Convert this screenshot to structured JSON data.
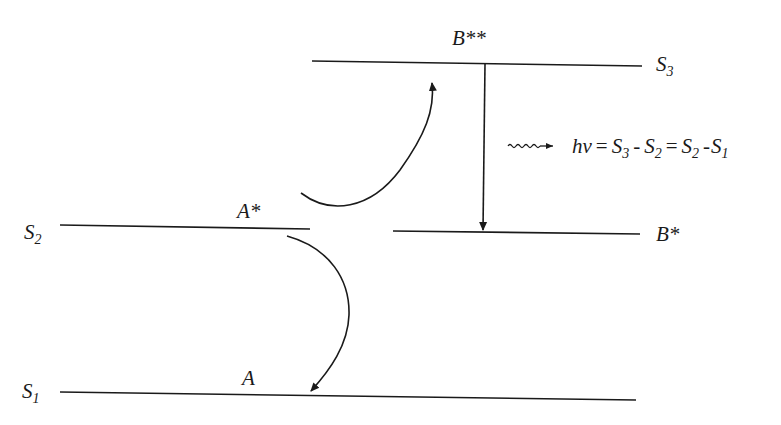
{
  "diagram": {
    "levels": {
      "s1": {
        "symbol": "S",
        "sub": "1",
        "label": "A"
      },
      "s2": {
        "symbol": "S",
        "sub": "2",
        "label": "A*"
      },
      "s2_b": {
        "label": "B*"
      },
      "s3": {
        "symbol": "S",
        "sub": "3",
        "label": "B**"
      }
    },
    "equation": {
      "lhs": "hν",
      "eq1": "=",
      "t1": "S",
      "t1_sub": "3",
      "minus1": "-",
      "t2": "S",
      "t2_sub": "2",
      "eq2": "=",
      "t3": "S",
      "t3_sub": "2",
      "minus2": "-",
      "t4": "S",
      "t4_sub": "1"
    },
    "colors": {
      "ink": "#1a1a1a",
      "background": "#ffffff"
    }
  }
}
